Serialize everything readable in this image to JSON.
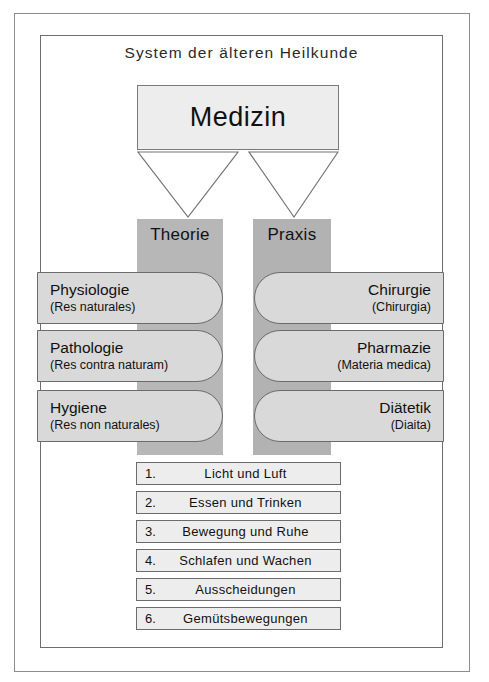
{
  "diagram": {
    "title": "System der älteren Heilkunde",
    "root": {
      "label": "Medizin"
    },
    "columns": [
      {
        "label": "Theorie"
      },
      {
        "label": "Praxis"
      }
    ],
    "theorie_items": [
      {
        "name": "Physiologie",
        "latin": "(Res naturales)"
      },
      {
        "name": "Pathologie",
        "latin": "(Res contra naturam)"
      },
      {
        "name": "Hygiene",
        "latin": "(Res non naturales)"
      }
    ],
    "praxis_items": [
      {
        "name": "Chirurgie",
        "latin": "(Chirurgia)"
      },
      {
        "name": "Pharmazie",
        "latin": "(Materia medica)"
      },
      {
        "name": "Diätetik",
        "latin": "(Diaita)"
      }
    ],
    "res_non_naturales": [
      {
        "num": "1.",
        "text": "Licht und Luft"
      },
      {
        "num": "2.",
        "text": "Essen und Trinken"
      },
      {
        "num": "3.",
        "text": "Bewegung und Ruhe"
      },
      {
        "num": "4.",
        "text": "Schlafen und Wachen"
      },
      {
        "num": "5.",
        "text": "Ausscheidungen"
      },
      {
        "num": "6.",
        "text": "Gemütsbewegungen"
      }
    ],
    "colors": {
      "column_theorie": "#b7b7b7",
      "column_praxis": "#b2b2b2",
      "pill_fill": "#d9d9d9",
      "box_fill": "#ededed",
      "stroke": "#6b6b6b"
    }
  }
}
